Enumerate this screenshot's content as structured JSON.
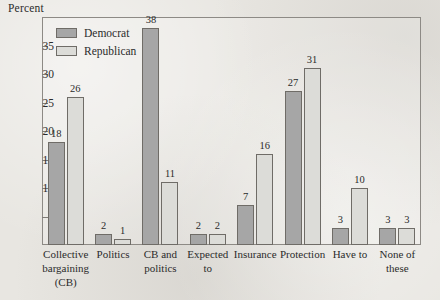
{
  "chart_data": {
    "type": "bar",
    "title": "",
    "subtitle": "",
    "xlabel": "",
    "ylabel": "Percent",
    "ylim": [
      0,
      40
    ],
    "yticks": [
      5,
      10,
      15,
      20,
      25,
      30,
      35
    ],
    "ytick_labels": [
      "5",
      "10",
      "15",
      "20",
      "25",
      "30",
      "35"
    ],
    "grid": false,
    "legend_position": "top-left-inside",
    "categories": [
      "Collective bargaining (CB)",
      "Politics",
      "CB and politics",
      "Expected to",
      "Insurance",
      "Protection",
      "Have to",
      "None of these"
    ],
    "category_lines": [
      [
        "Collective",
        "bargaining",
        "(CB)"
      ],
      [
        "Politics"
      ],
      [
        "CB and",
        "politics"
      ],
      [
        "Expected",
        "to"
      ],
      [
        "Insurance"
      ],
      [
        "Protection"
      ],
      [
        "Have to"
      ],
      [
        "None of",
        "these"
      ]
    ],
    "series": [
      {
        "name": "Democrat",
        "color": "#a6a6a6",
        "values": [
          18,
          2,
          38,
          2,
          7,
          27,
          3,
          3
        ]
      },
      {
        "name": "Republican",
        "color": "#dcdcd8",
        "values": [
          26,
          1,
          11,
          2,
          16,
          31,
          10,
          3
        ]
      }
    ],
    "data_labels": {
      "Democrat": [
        "18",
        "2",
        "38",
        "2",
        "7",
        "27",
        "3",
        "3"
      ],
      "Republican": [
        "26",
        "1",
        "11",
        "2",
        "16",
        "31",
        "10",
        "3"
      ]
    }
  },
  "legend": {
    "items": [
      {
        "label": "Democrat",
        "swatch": "dem"
      },
      {
        "label": "Republican",
        "swatch": "rep"
      }
    ]
  }
}
